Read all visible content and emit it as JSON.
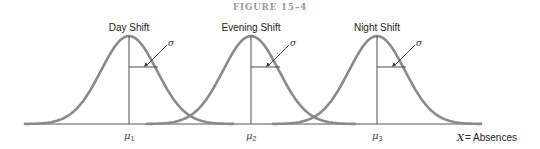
{
  "figure": {
    "title": "FIGURE 15–4",
    "x_axis_label_var": "X",
    "x_axis_label_rest": " = Absences",
    "sigma_symbol": "σ",
    "mu_symbol": "μ",
    "curves": [
      {
        "label": "Day Shift",
        "mean_label_sub": "1",
        "mean_x": 129
      },
      {
        "label": "Evening Shift",
        "mean_label_sub": "2",
        "mean_x": 251
      },
      {
        "label": "Night Shift",
        "mean_label_sub": "3",
        "mean_x": 377
      }
    ],
    "colors": {
      "curve": "#8a8a8a",
      "lines": "#3a3a3a",
      "text": "#222222"
    }
  },
  "chart_data": {
    "type": "line",
    "title": "FIGURE 15–4",
    "xlabel": "X = Absences",
    "ylabel": "",
    "series": [
      {
        "name": "Day Shift",
        "distribution": "normal",
        "mean_label": "μ1",
        "sigma_label": "σ"
      },
      {
        "name": "Evening Shift",
        "distribution": "normal",
        "mean_label": "μ2",
        "sigma_label": "σ"
      },
      {
        "name": "Night Shift",
        "distribution": "normal",
        "mean_label": "μ3",
        "sigma_label": "σ"
      }
    ],
    "x_tick_labels": [
      "μ1",
      "μ2",
      "μ3"
    ],
    "grid": false
  }
}
